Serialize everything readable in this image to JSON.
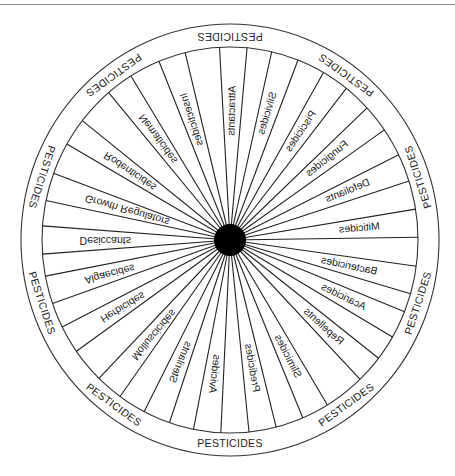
{
  "diagram": {
    "type": "wheel",
    "center_label": "",
    "ring_label": "PESTICIDES",
    "ring_label_count": 10,
    "colors": {
      "line": "#222222",
      "hub": "#000000",
      "background": "#ffffff"
    },
    "sectors": [
      {
        "label": "Attractants",
        "angle": -89
      },
      {
        "label": "Silvicides",
        "angle": -73
      },
      {
        "label": "Piscicides",
        "angle": -56
      },
      {
        "label": "Fungicides",
        "angle": -39
      },
      {
        "label": "Defoliants",
        "angle": -22
      },
      {
        "label": "Miticides",
        "angle": -5
      },
      {
        "label": "Bactericides",
        "angle": 12
      },
      {
        "label": "Acaricides",
        "angle": 26
      },
      {
        "label": "Repellents",
        "angle": 42
      },
      {
        "label": "Slimicides",
        "angle": 63
      },
      {
        "label": "Predicides",
        "angle": 80
      },
      {
        "label": "Avicides",
        "angle": 97
      },
      {
        "label": "Sterilants",
        "angle": 113
      },
      {
        "label": "Molluscicides",
        "angle": 130
      },
      {
        "label": "Herbicides",
        "angle": 149
      },
      {
        "label": "Algaecides",
        "angle": 165
      },
      {
        "label": "Desiccants",
        "angle": 180
      },
      {
        "label": "Growth Regulators",
        "angle": 196
      },
      {
        "label": "Rodenticides",
        "angle": 214
      },
      {
        "label": "Nematicides",
        "angle": 234
      },
      {
        "label": "Insecticides",
        "angle": 252
      }
    ]
  }
}
